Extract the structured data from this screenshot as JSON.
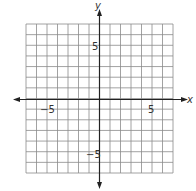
{
  "chart_data": {
    "type": "scatter",
    "title": "",
    "xlabel": "x",
    "ylabel": "y",
    "xlim": [
      -7,
      7
    ],
    "ylim": [
      -7,
      7
    ],
    "grid": true,
    "grid_step": 1,
    "x_tick_labels": [
      {
        "value": -5,
        "label": "−5"
      },
      {
        "value": 5,
        "label": "5"
      }
    ],
    "y_tick_labels": [
      {
        "value": 5,
        "label": "5"
      },
      {
        "value": -5,
        "label": "−5"
      }
    ],
    "series": [],
    "legend": null
  },
  "labels": {
    "x_axis": "x",
    "y_axis": "y",
    "x_neg5": "−5",
    "x_pos5": "5",
    "y_pos5": "5",
    "y_neg5": "−5"
  },
  "colors": {
    "grid": "#8a8a8a",
    "axis": "#222222",
    "background": "#ffffff"
  }
}
